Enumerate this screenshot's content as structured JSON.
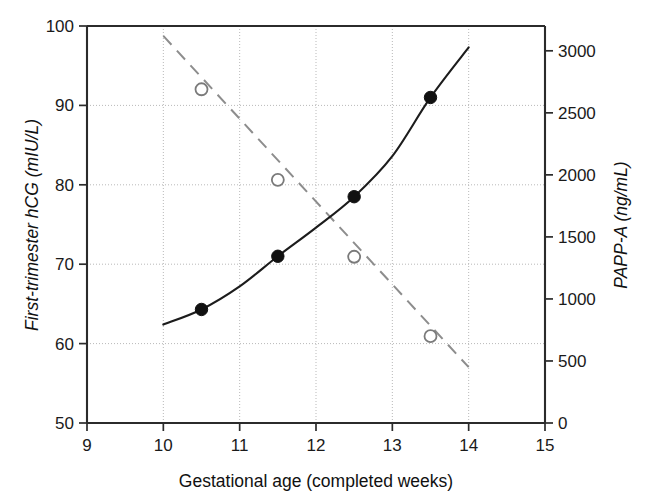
{
  "chart_data": {
    "type": "scatter",
    "title": "",
    "subtitle": "",
    "xlabel": "Gestational age (completed weeks)",
    "ylabel": "First-trimester hCG (mIU/L)",
    "ylabel_right": "PAPP-A (ng/mL)",
    "xlim": [
      9,
      15
    ],
    "ylim": [
      50,
      100
    ],
    "ylim_right": [
      0,
      3200
    ],
    "xticks": [
      9,
      10,
      11,
      12,
      13,
      14,
      15
    ],
    "xtick_labels": [
      "9",
      "10",
      "11",
      "12",
      "13",
      "14",
      "15"
    ],
    "yticks": [
      50,
      60,
      70,
      80,
      90,
      100
    ],
    "ytick_labels": [
      "50",
      "60",
      "70",
      "80",
      "90",
      "100"
    ],
    "yticks_right": [
      0,
      500,
      1000,
      1500,
      2000,
      2500,
      3000
    ],
    "ytick_labels_right": [
      "0",
      "500",
      "1000",
      "1500",
      "2000",
      "2500",
      "3000"
    ],
    "grid": true,
    "grid_style": "dotted",
    "legend": null,
    "series": [
      {
        "name": "First-trimester hCG (mIU/L)",
        "axis": "left",
        "marker": "filled-circle",
        "line_style": "solid",
        "color": "#111111",
        "x": [
          10.5,
          11.5,
          12.5,
          13.5
        ],
        "values": [
          64.3,
          71.0,
          78.5,
          91.0
        ],
        "fit_curve_x": [
          10.0,
          10.5,
          11.0,
          11.5,
          12.0,
          12.5,
          13.0,
          13.5,
          14.0
        ],
        "fit_curve_y": [
          62.4,
          64.3,
          67.2,
          71.0,
          74.6,
          78.5,
          83.6,
          91.0,
          97.3
        ]
      },
      {
        "name": "PAPP-A (ng/mL)",
        "axis": "right",
        "marker": "open-circle",
        "line_style": "dashed",
        "color": "#8d8d8d",
        "x": [
          10.5,
          11.5,
          12.5,
          13.5
        ],
        "values": [
          2690,
          1960,
          1340,
          700
        ],
        "fit_curve_x": [
          10.0,
          14.0
        ],
        "fit_curve_y": [
          3120,
          450
        ]
      }
    ]
  },
  "axes": {
    "x_title": "Gestational age (completed weeks)",
    "y_left_title": "First-trimester hCG (mIU/L)",
    "y_right_title": "PAPP-A (ng/mL)"
  }
}
